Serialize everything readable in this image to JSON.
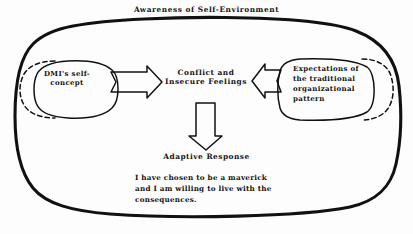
{
  "diagram": {
    "title": "Awareness of Self-Environment",
    "type": "conceptual-flow-diagram",
    "colors": {
      "stroke": "#111111",
      "background": "#ffffff",
      "text": "#141414"
    },
    "boundary": {
      "name": "awareness-boundary",
      "shape": "rounded-rectangle",
      "style": "solid-thick-hand-drawn"
    },
    "nodes": [
      {
        "id": "left-node",
        "label": "DMI's self-\nconcept",
        "shape": "ellipse",
        "position": "left",
        "straddles_boundary": true,
        "outer_arc_style": "dashed"
      },
      {
        "id": "center-node",
        "label": "Conflict and\nInsecure Feelings",
        "shape": "none",
        "position": "center",
        "straddles_boundary": false
      },
      {
        "id": "right-node",
        "label": "Expectations of\nthe traditional\norganizational\npattern",
        "shape": "rounded-ellipse",
        "position": "right",
        "straddles_boundary": true,
        "outer_arc_style": "dashed"
      },
      {
        "id": "response-node",
        "label": "Adaptive Response",
        "shape": "none",
        "position": "bottom-center",
        "straddles_boundary": false
      }
    ],
    "arrows": [
      {
        "id": "arrow-left-to-center",
        "direction": "right",
        "style": "hollow-block",
        "from": "left-node",
        "to": "center-node"
      },
      {
        "id": "arrow-right-to-center",
        "direction": "left",
        "style": "hollow-block",
        "from": "right-node",
        "to": "center-node"
      },
      {
        "id": "arrow-center-to-response",
        "direction": "down",
        "style": "hollow-block",
        "from": "center-node",
        "to": "response-node"
      }
    ],
    "statement": "I have chosen to be a maverick\nand I am willing to live with the\nconsequences."
  }
}
